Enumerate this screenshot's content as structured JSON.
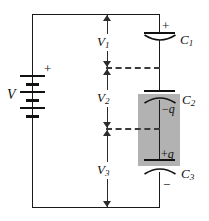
{
  "figure": {
    "type": "circuit-diagram",
    "width": 209,
    "height": 221,
    "background": "#ffffff",
    "wire_color": "#1a1a1a",
    "shade_color": "#b2b2b2",
    "dash_color": "#3a3a3a"
  },
  "source": {
    "name": "battery",
    "label": "V",
    "polarity_top": "+",
    "cell_count": 3
  },
  "capacitors": [
    {
      "id": "c1",
      "label": "C",
      "subscript": "1",
      "terminal_sign": "+",
      "sign_position": "above"
    },
    {
      "id": "c2",
      "label": "C",
      "subscript": "2",
      "charge_label": "−q",
      "charge_sign": "−",
      "charge_symbol": "q"
    },
    {
      "id": "c3",
      "label": "C",
      "subscript": "3",
      "charge_label": "+q",
      "charge_sign": "+",
      "charge_symbol": "q",
      "terminal_sign": "−",
      "sign_position": "below"
    }
  ],
  "voltages": [
    {
      "id": "v1",
      "label": "V",
      "subscript": "1"
    },
    {
      "id": "v2",
      "label": "V",
      "subscript": "2"
    },
    {
      "id": "v3",
      "label": "V",
      "subscript": "3"
    }
  ],
  "labels": {
    "v1_text": "V",
    "v1_sub": "1",
    "v2_text": "V",
    "v2_sub": "2",
    "v3_text": "V",
    "v3_sub": "3",
    "c1_text": "C",
    "c1_sub": "1",
    "c2_text": "C",
    "c2_sub": "2",
    "c3_text": "C",
    "c3_sub": "3",
    "battery_text": "V",
    "battery_plus": "+",
    "c1_plus": "+",
    "c3_minus": "−",
    "neg_q_sign": "−",
    "pos_q_sign": "+",
    "q_symbol": "q"
  }
}
